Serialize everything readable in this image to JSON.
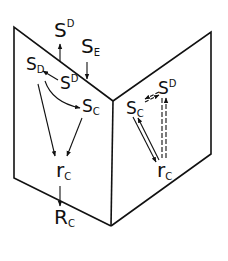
{
  "diagram": {
    "type": "two-panel folded diagram",
    "colors": {
      "ink": "#111111",
      "background": "#ffffff"
    },
    "outside": {
      "top_left_label": {
        "base": "S",
        "sup": "D"
      },
      "top_right_label": {
        "base": "S",
        "sub": "E"
      },
      "bottom_label": {
        "base": "R",
        "sub": "C"
      }
    },
    "left_panel": {
      "nodes": [
        {
          "id": "SD_left",
          "base": "S",
          "sub": "D"
        },
        {
          "id": "SupD",
          "base": "S",
          "sup": "D"
        },
        {
          "id": "SC",
          "base": "S",
          "sub": "C"
        },
        {
          "id": "rC",
          "base": "r",
          "sub": "C"
        }
      ],
      "edges": [
        {
          "from": "SupD",
          "to": "SD_left",
          "style": "solid"
        },
        {
          "from": "SD_left",
          "to": "SC",
          "style": "solid-curved"
        },
        {
          "from": "SD_left",
          "to": "rC",
          "style": "solid"
        },
        {
          "from": "SC",
          "to": "rC",
          "style": "solid"
        }
      ]
    },
    "right_panel": {
      "nodes": [
        {
          "id": "SC",
          "base": "S",
          "sub": "C"
        },
        {
          "id": "SupD",
          "base": "S",
          "sup": "D"
        },
        {
          "id": "rC",
          "base": "r",
          "sub": "C"
        }
      ],
      "edges": [
        {
          "from": "SupD",
          "to": "SC",
          "style": "dashed-double"
        },
        {
          "from": "SC",
          "to": "rC",
          "style": "solid-double"
        },
        {
          "from": "rC",
          "to": "SupD",
          "style": "dashed-double"
        }
      ]
    },
    "external_edges": [
      {
        "from": "left_panel_top",
        "to": "S^D",
        "style": "solid"
      },
      {
        "from": "S_E",
        "to": "left_panel_top",
        "style": "solid"
      },
      {
        "from": "rC",
        "to": "R_C",
        "style": "solid"
      }
    ]
  }
}
